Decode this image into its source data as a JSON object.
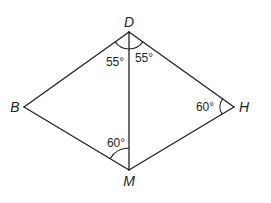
{
  "figure": {
    "type": "geometry-diagram",
    "shape": "quadrilateral with diagonal DM",
    "stroke_color": "#231f20",
    "background": "#ffffff"
  },
  "vertices": {
    "D": {
      "label": "D",
      "x": 129,
      "y": 32
    },
    "B": {
      "label": "B",
      "x": 24,
      "y": 107
    },
    "H": {
      "label": "H",
      "x": 234,
      "y": 107
    },
    "M": {
      "label": "M",
      "x": 129,
      "y": 170
    }
  },
  "segments": [
    {
      "from": "D",
      "to": "B"
    },
    {
      "from": "D",
      "to": "H"
    },
    {
      "from": "D",
      "to": "M"
    },
    {
      "from": "B",
      "to": "M"
    },
    {
      "from": "H",
      "to": "M"
    }
  ],
  "angles": {
    "BDM": {
      "label": "55°",
      "vertex": "D"
    },
    "MDH": {
      "label": "55°",
      "vertex": "D"
    },
    "DHM": {
      "label": "60°",
      "vertex": "H"
    },
    "BMD": {
      "label": "60°",
      "vertex": "M"
    }
  }
}
